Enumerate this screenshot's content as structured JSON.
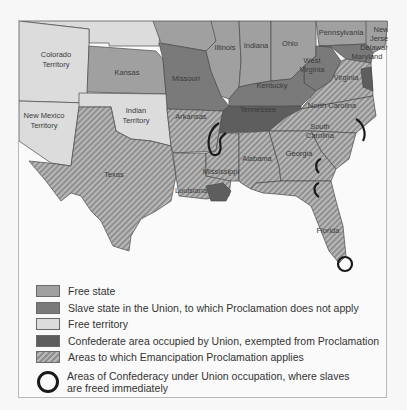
{
  "map": {
    "colors": {
      "free_state": "#a0a0a0",
      "slave_state_union": "#7a7a7a",
      "free_territory": "#dcdcdc",
      "confederate_occupied_exempt": "#5e5e5e",
      "proclamation_applies_stripe_a": "#8f8f8f",
      "proclamation_applies_stripe_b": "#b8b8b8",
      "occupation_ring": "#1a1a1a"
    },
    "labels": {
      "colorado": [
        "Colorado",
        "Territory"
      ],
      "kansas": "Kansas",
      "missouri": "Missouri",
      "illinois": "Illinois",
      "indiana": "Indiana",
      "ohio": "Ohio",
      "pennsylvania": "Pennsylvania",
      "new_jersey": [
        "New",
        "Jersey"
      ],
      "delaware": "Delaware",
      "maryland": "Maryland",
      "west_virginia": [
        "West",
        "Virginia"
      ],
      "virginia": "Virginia",
      "kentucky": "Kentucky",
      "tennessee": "Tennessee",
      "north_carolina": "North Carolina",
      "south_carolina": [
        "South",
        "Carolina"
      ],
      "new_mexico": [
        "New Mexico",
        "Territory"
      ],
      "indian": [
        "Indian",
        "Territory"
      ],
      "arkansas": "Arkansas",
      "texas": "Texas",
      "louisiana": "Louisiana",
      "mississippi": "Mississippi",
      "alabama": "Alabama",
      "georgia": "Georgia",
      "florida": "Florida"
    }
  },
  "legend": {
    "items": [
      {
        "key": "free-state",
        "label": "Free state"
      },
      {
        "key": "slave-union",
        "label": "Slave state in the Union, to which Proclamation does not apply"
      },
      {
        "key": "free-territory",
        "label": "Free territory"
      },
      {
        "key": "occupied-exempt",
        "label": "Confederate area occupied by Union, exempted from Proclamation"
      },
      {
        "key": "applies",
        "label": "Areas to which Emancipation Proclamation applies"
      },
      {
        "key": "ring",
        "label": "Areas of Confederacy under Union occupation, where slaves are freed immediately"
      }
    ]
  }
}
